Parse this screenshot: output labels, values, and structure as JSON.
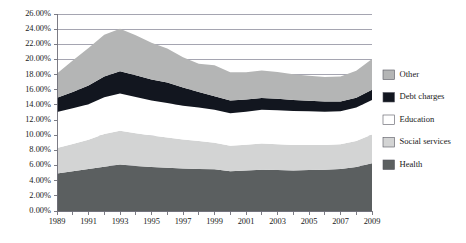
{
  "chart_data": {
    "type": "area",
    "stacked": true,
    "title": "",
    "subtitle": "",
    "xlabel": "",
    "ylabel": "",
    "xlim": [
      1989,
      2009
    ],
    "ylim": [
      0.0,
      26.0
    ],
    "ytick_step": 2.0,
    "grid": true,
    "legend_position": "right",
    "x": [
      1989,
      1990,
      1991,
      1992,
      1993,
      1994,
      1995,
      1996,
      1997,
      1998,
      1999,
      2000,
      2001,
      2002,
      2003,
      2004,
      2005,
      2006,
      2007,
      2008,
      2009
    ],
    "xtick_labels": [
      "1989",
      "1991",
      "1993",
      "1995",
      "1997",
      "1999",
      "2001",
      "2003",
      "2005",
      "2007",
      "2009"
    ],
    "ytick_labels": [
      "0.00%",
      "2.00%",
      "4.00%",
      "6.00%",
      "8.00%",
      "10.00%",
      "12.00%",
      "14.00%",
      "16.00%",
      "18.00%",
      "20.00%",
      "22.00%",
      "24.00%",
      "26.00%"
    ],
    "stack_order_bottom_to_top": [
      "Health",
      "Social services",
      "Education",
      "Debt charges",
      "Other"
    ],
    "series": [
      {
        "name": "Health",
        "color": "#5b5f60",
        "values": [
          4.95,
          5.25,
          5.55,
          5.85,
          6.15,
          5.95,
          5.8,
          5.7,
          5.6,
          5.55,
          5.5,
          5.25,
          5.35,
          5.45,
          5.4,
          5.35,
          5.4,
          5.45,
          5.55,
          5.8,
          6.3
        ]
      },
      {
        "name": "Social services",
        "color": "#d3d4d4",
        "values": [
          3.35,
          3.6,
          3.85,
          4.3,
          4.45,
          4.3,
          4.15,
          4.0,
          3.85,
          3.7,
          3.5,
          3.35,
          3.4,
          3.45,
          3.4,
          3.35,
          3.3,
          3.25,
          3.25,
          3.45,
          3.8
        ]
      },
      {
        "name": "Education",
        "color": "#ffffff",
        "values": [
          4.75,
          4.7,
          4.7,
          4.85,
          4.9,
          4.8,
          4.65,
          4.55,
          4.45,
          4.4,
          4.35,
          4.3,
          4.35,
          4.45,
          4.5,
          4.5,
          4.45,
          4.4,
          4.35,
          4.4,
          4.55
        ]
      },
      {
        "name": "Debt charges",
        "color": "#12161f",
        "values": [
          1.9,
          2.15,
          2.45,
          2.75,
          2.95,
          2.85,
          2.75,
          2.7,
          2.4,
          2.05,
          1.8,
          1.7,
          1.6,
          1.55,
          1.5,
          1.45,
          1.4,
          1.35,
          1.3,
          1.3,
          1.35
        ]
      },
      {
        "name": "Other",
        "color": "#b4b5b5",
        "values": [
          3.2,
          4.15,
          4.95,
          5.5,
          5.6,
          5.3,
          4.85,
          4.5,
          4.0,
          3.75,
          4.1,
          3.7,
          3.6,
          3.65,
          3.55,
          3.4,
          3.3,
          3.25,
          3.3,
          3.55,
          4.05
        ]
      }
    ],
    "axis_color": "#6e6e78",
    "gridline_color": "#8e8e9e",
    "background": "#ffffff"
  },
  "legend": {
    "items": [
      {
        "label": "Other",
        "color": "#b4b5b5"
      },
      {
        "label": "Debt charges",
        "color": "#12161f"
      },
      {
        "label": "Education",
        "color": "#ffffff"
      },
      {
        "label": "Social services",
        "color": "#d3d4d4"
      },
      {
        "label": "Health",
        "color": "#5b5f60"
      }
    ]
  }
}
